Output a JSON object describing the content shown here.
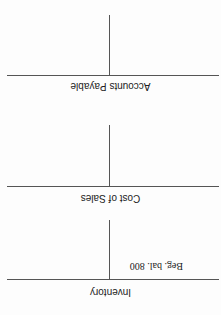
{
  "accounts": [
    {
      "title": "Inventory",
      "debit_entries": [
        "Beg. bal. 800"
      ],
      "credit_entries": []
    },
    {
      "title": "Cost of Sales",
      "debit_entries": [],
      "credit_entries": []
    },
    {
      "title": "Accounts Payable",
      "debit_entries": [],
      "credit_entries": []
    }
  ],
  "colors": {
    "line": "#555555",
    "text": "#222222"
  }
}
